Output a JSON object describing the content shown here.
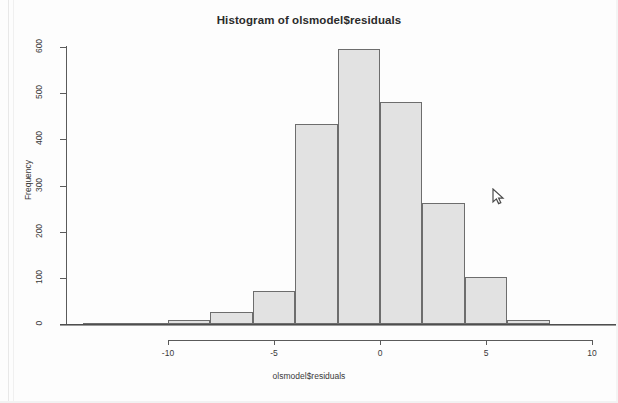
{
  "chart_data": {
    "type": "bar",
    "title": "Histogram of olsmodel$residuals",
    "xlabel": "olsmodel$residuals",
    "ylabel": "Frequency",
    "bin_width": 2,
    "bin_edges": [
      -14,
      -12,
      -10,
      -8,
      -6,
      -4,
      -2,
      0,
      2,
      4,
      6,
      8
    ],
    "categories": [
      "-14 to -12",
      "-12 to -10",
      "-10 to -8",
      "-8 to -6",
      "-6 to -4",
      "-4 to -2",
      "-2 to 0",
      "0 to 2",
      "2 to 4",
      "4 to 6",
      "6 to 8"
    ],
    "bin_centers": [
      -13,
      -11,
      -9,
      -7,
      -5,
      -3,
      -1,
      1,
      3,
      5,
      7
    ],
    "values": [
      1,
      2,
      8,
      25,
      72,
      434,
      595,
      480,
      262,
      101,
      8
    ],
    "xlim": [
      -14,
      10
    ],
    "ylim": [
      0,
      600
    ],
    "xticks": [
      -10,
      -5,
      0,
      5,
      10
    ],
    "xtick_labels": [
      "-10",
      "-5",
      "0",
      "5",
      "10"
    ],
    "yticks": [
      0,
      100,
      200,
      300,
      400,
      500,
      600
    ],
    "ytick_labels": [
      "0",
      "100",
      "200",
      "300",
      "400",
      "500",
      "600"
    ],
    "grid": false,
    "legend": false,
    "bar_fill_color": "#e2e2e2",
    "bar_border_color": "#6d6d6d",
    "background_color": "#fdfdfd",
    "text_color": "#3a3a3a"
  },
  "cursor": {
    "name": "mouse-pointer",
    "x": 492,
    "y": 188
  }
}
